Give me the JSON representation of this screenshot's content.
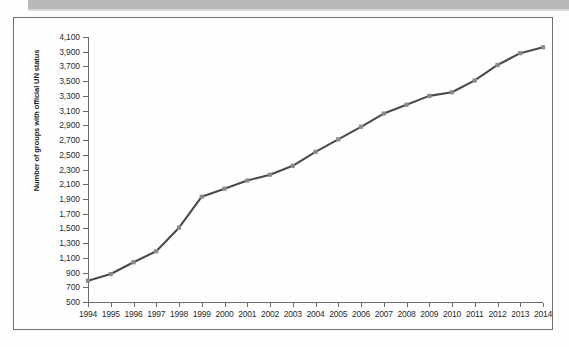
{
  "figure": {
    "frame_border_color": "#6f6f6f",
    "background_color": "#fefefe",
    "banner_color": "#b9b9b9"
  },
  "chart_data": {
    "type": "line",
    "title": "",
    "subtitle": "",
    "xlabel": "",
    "ylabel": "Number of groups with official UN status",
    "x": [
      1994,
      1995,
      1996,
      1997,
      1998,
      1999,
      2000,
      2001,
      2002,
      2003,
      2004,
      2005,
      2006,
      2007,
      2008,
      2009,
      2010,
      2011,
      2012,
      2013,
      2014
    ],
    "categories": [
      "1994",
      "1995",
      "1996",
      "1997",
      "1998",
      "1999",
      "2000",
      "2001",
      "2002",
      "2003",
      "2004",
      "2005",
      "2006",
      "2007",
      "2008",
      "2009",
      "2010",
      "2011",
      "2012",
      "2013",
      "2014"
    ],
    "values": [
      790,
      880,
      1040,
      1190,
      1510,
      1930,
      2040,
      2150,
      2230,
      2350,
      2540,
      2710,
      2880,
      3060,
      3180,
      3300,
      3350,
      3510,
      3720,
      3880,
      3960
    ],
    "series": [
      {
        "name": "Number of groups with official UN status",
        "values": [
          790,
          880,
          1040,
          1190,
          1510,
          1930,
          2040,
          2150,
          2230,
          2350,
          2540,
          2710,
          2880,
          3060,
          3180,
          3300,
          3350,
          3510,
          3720,
          3880,
          3960
        ],
        "color": "#4a4a4a",
        "marker": "square",
        "marker_color": "#8a8a8a"
      }
    ],
    "ylim": [
      500,
      4100
    ],
    "ytick_step": 200,
    "ytick_labels": [
      "4,100",
      "3,900",
      "3,700",
      "3,500",
      "3,300",
      "3,100",
      "2,900",
      "2,700",
      "2,500",
      "2,300",
      "2,100",
      "1,900",
      "1,700",
      "1,500",
      "1,300",
      "1,100",
      "900",
      "700",
      "500"
    ],
    "ytick_values": [
      4100,
      3900,
      3700,
      3500,
      3300,
      3100,
      2900,
      2700,
      2500,
      2300,
      2100,
      1900,
      1700,
      1500,
      1300,
      1100,
      900,
      700,
      500
    ],
    "xlim": [
      1994,
      2014
    ],
    "grid": false,
    "legend": null,
    "legend_position": "none",
    "annotations": []
  }
}
